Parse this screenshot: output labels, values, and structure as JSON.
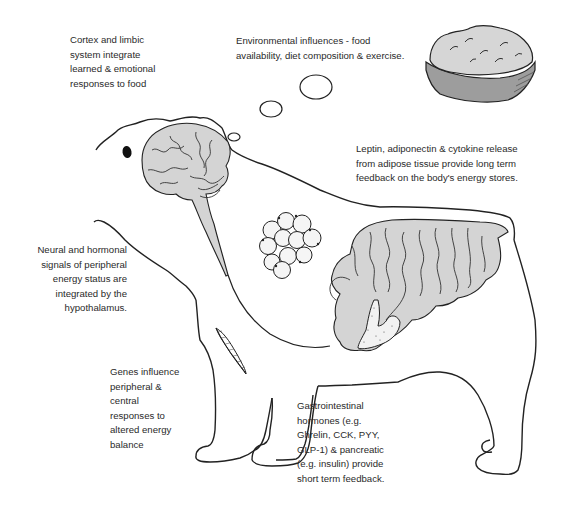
{
  "diagram": {
    "colors": {
      "organ_fill": "#d4d4d4",
      "outline": "#222222",
      "text": "#2a2a2a",
      "pancreas_fill": "#f2f2f2"
    },
    "labels": {
      "cortex": {
        "lines": [
          "Cortex and limbic",
          "system integrate",
          "learned & emotional",
          "responses to food"
        ]
      },
      "environment": {
        "lines": [
          "Environmental influences - food",
          "availability, diet composition & exercise."
        ]
      },
      "adipose": {
        "lines": [
          "Leptin, adiponectin & cytokine release",
          "from adipose tissue provide long term",
          "feedback on the body's energy stores."
        ]
      },
      "hypothalamus": {
        "lines": [
          "Neural and hormonal",
          "signals of peripheral",
          "energy status are",
          "integrated by the",
          "hypothalamus."
        ]
      },
      "genes": {
        "lines": [
          "Genes influence",
          "peripheral &",
          "central",
          "responses to",
          "altered energy",
          "balance"
        ]
      },
      "gastrointestinal": {
        "lines": [
          "Gastrointestinal",
          "hormones (e.g.",
          "Ghrelin, CCK, PYY,",
          "GLP-1) & pancreatic",
          "(e.g. insulin) provide",
          "short term feedback."
        ]
      }
    },
    "icons": [
      "food-bowl-icon",
      "thought-bubbles",
      "brain-icon",
      "adipocyte-cluster-icon",
      "gut-icon",
      "pancreas-icon",
      "dna-helix-icon",
      "dog-eye"
    ]
  }
}
